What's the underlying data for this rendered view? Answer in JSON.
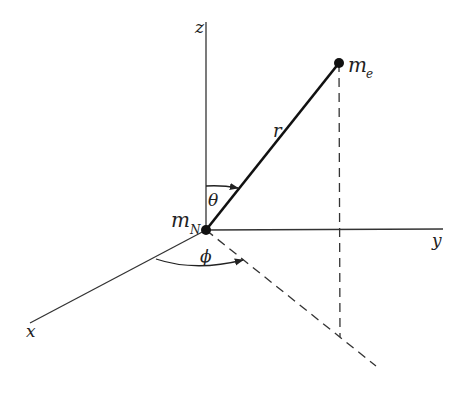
{
  "diagram": {
    "axes": {
      "x_label": "x",
      "y_label": "y",
      "z_label": "z"
    },
    "points": {
      "nucleus_label": "m",
      "nucleus_sub": "N",
      "electron_label": "m",
      "electron_sub": "e"
    },
    "radius_label": "r",
    "angles": {
      "theta_label": "θ",
      "phi_label": "ϕ"
    },
    "colors": {
      "line": "#222222",
      "background": "#ffffff"
    }
  }
}
